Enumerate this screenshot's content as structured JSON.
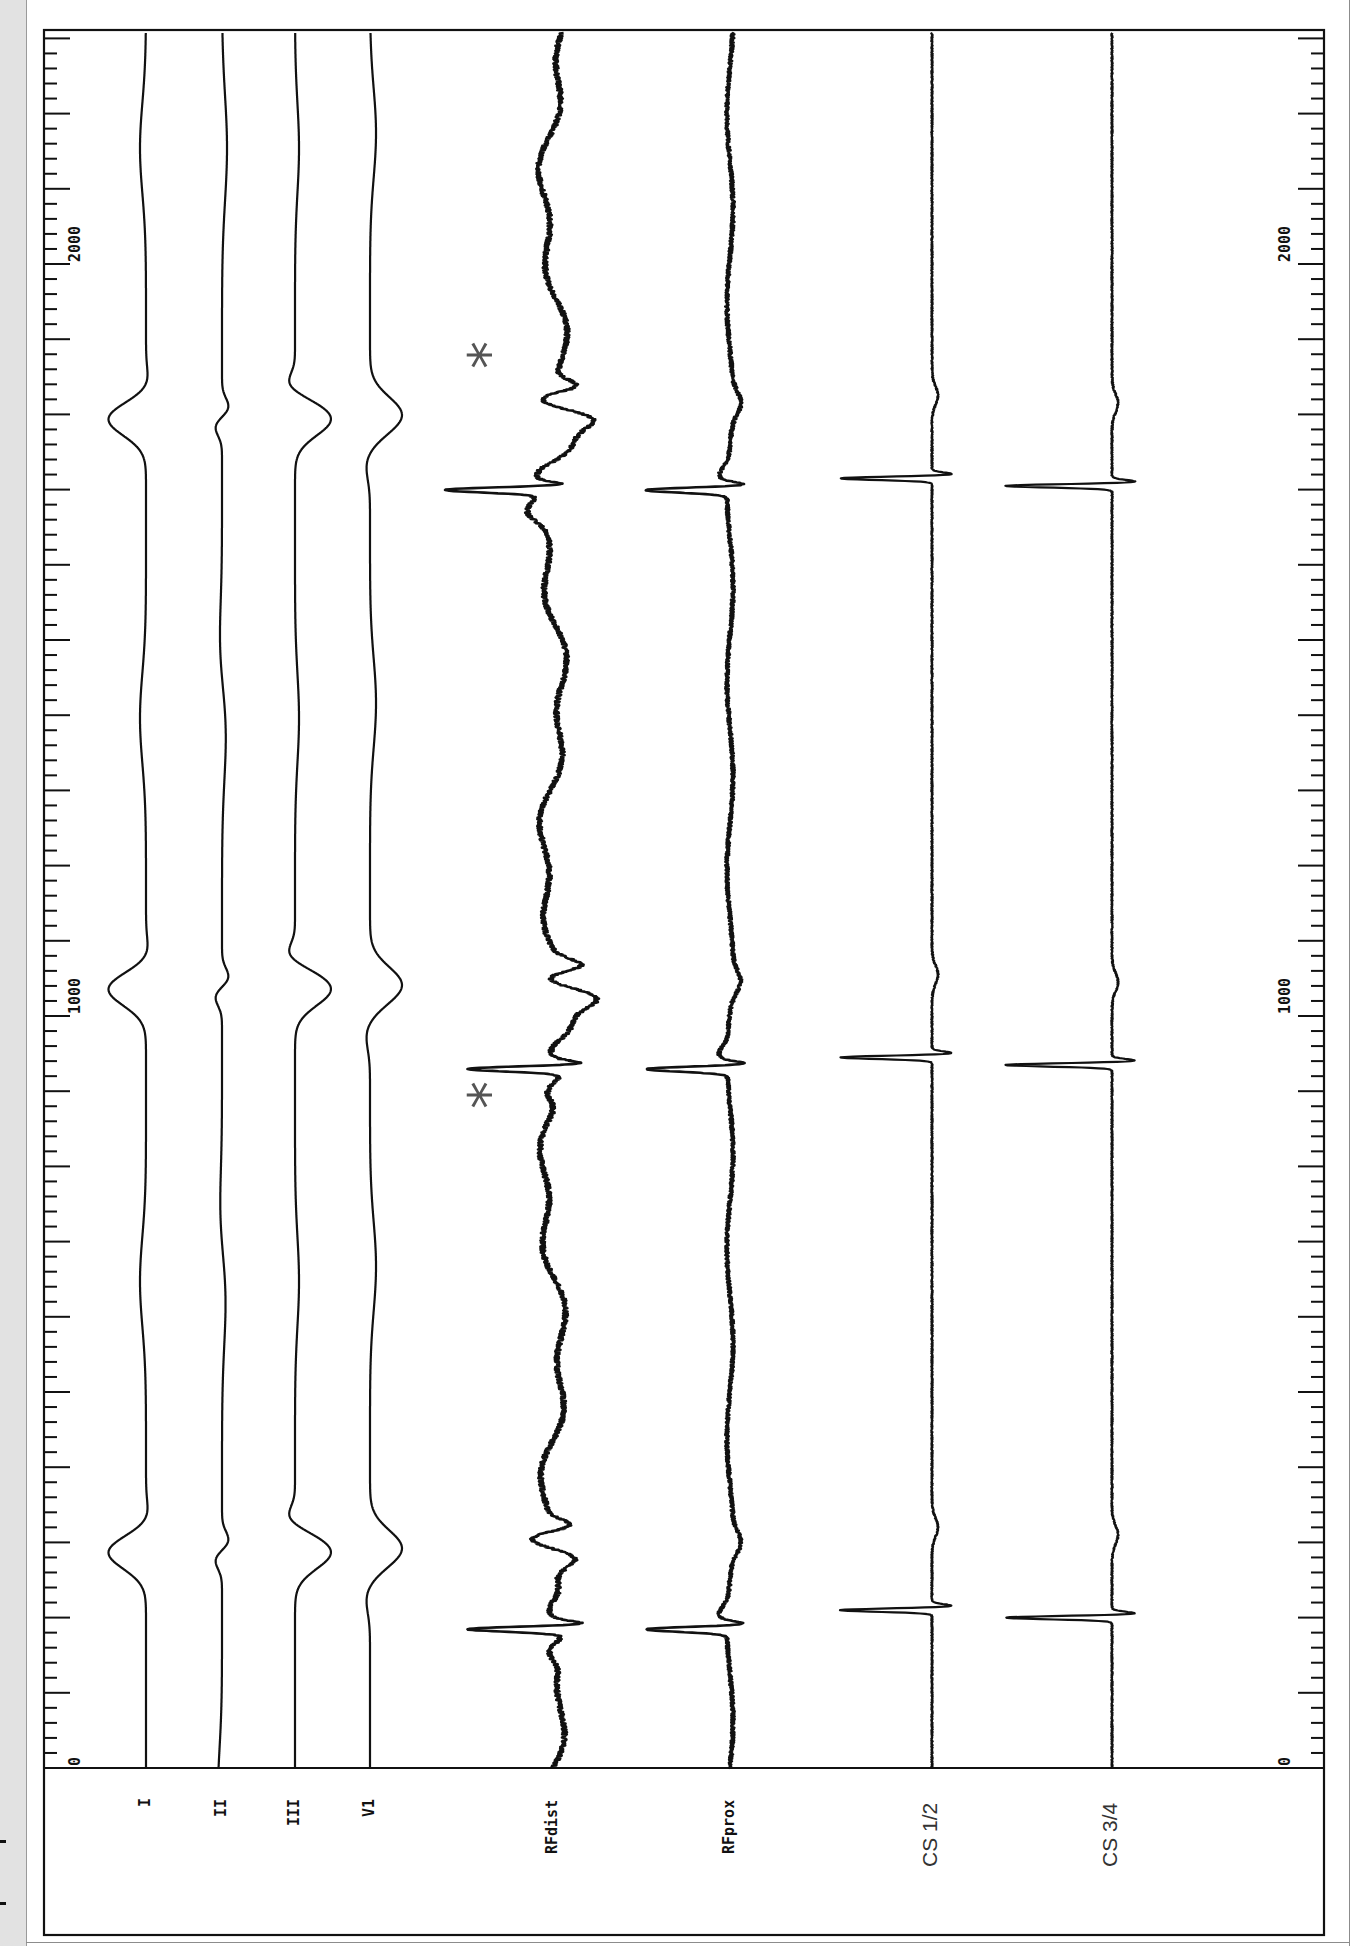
{
  "figure": {
    "title": "",
    "orientation": "rotated-90",
    "colors": {
      "trace": "#111111",
      "frame": "#111111",
      "annotation": "#555555",
      "background": "#ffffff",
      "page": "#e2e2e2"
    }
  },
  "axis": {
    "unit": "ms",
    "tick_labels_left": [
      "0",
      "1000",
      "2000"
    ],
    "tick_labels_right": [
      "0",
      "1000",
      "2000"
    ],
    "minor_tick_ms": 20,
    "major_tick_ms": 100,
    "range_ms": [
      0,
      2320
    ]
  },
  "channels": [
    {
      "id": "I",
      "label": "I",
      "style": "mono"
    },
    {
      "id": "II",
      "label": "II",
      "style": "mono"
    },
    {
      "id": "III",
      "label": "III",
      "style": "mono"
    },
    {
      "id": "V1",
      "label": "V1",
      "style": "mono"
    },
    {
      "id": "RFdist",
      "label": "RFdist",
      "style": "mono"
    },
    {
      "id": "RFprox",
      "label": "RFprox",
      "style": "mono"
    },
    {
      "id": "CS12",
      "label": "CS 1/2",
      "style": "sans"
    },
    {
      "id": "CS34",
      "label": "CS 3/4",
      "style": "sans"
    }
  ],
  "annotations": [
    {
      "symbol": "*",
      "channel": "RFdist",
      "time_ms": 905
    },
    {
      "symbol": "*",
      "channel": "RFdist",
      "time_ms": 1890
    }
  ],
  "chart_data": {
    "type": "line",
    "xlabel": "Time (ms)",
    "ylabel": "",
    "xlim": [
      0,
      2320
    ],
    "x_ticks": [
      0,
      1000,
      2000
    ],
    "grid": false,
    "legend": "channel labels along time axis origin",
    "series": [
      {
        "name": "I",
        "beat_times_ms": [
          287,
          1036,
          1794
        ],
        "deflection": "negative QRS",
        "amplitude_rel": 0.45
      },
      {
        "name": "II",
        "beat_times_ms": [
          287,
          1036,
          1794
        ],
        "deflection": "low-amplitude biphasic",
        "amplitude_rel": 0.1
      },
      {
        "name": "III",
        "beat_times_ms": [
          287,
          1036,
          1794
        ],
        "deflection": "positive QRS",
        "amplitude_rel": 0.45
      },
      {
        "name": "V1",
        "beat_times_ms": [
          287,
          1036,
          1794
        ],
        "deflection": "positive QRS",
        "amplitude_rel": 0.4
      },
      {
        "name": "RFdist",
        "beat_times_ms": [
          185,
          930,
          1700
        ],
        "deflection": "large sharp biphasic spike + far-field",
        "amplitude_rel": 1.3
      },
      {
        "name": "RFprox",
        "beat_times_ms": [
          185,
          930,
          1700
        ],
        "deflection": "sharp biphasic spike",
        "amplitude_rel": 1.25
      },
      {
        "name": "CS 1/2",
        "beat_times_ms": [
          210,
          945,
          1715
        ],
        "deflection": "sharp narrow spike",
        "amplitude_rel": 1.3
      },
      {
        "name": "CS 3/4",
        "beat_times_ms": [
          200,
          935,
          1705
        ],
        "deflection": "sharp narrow spike",
        "amplitude_rel": 1.5
      }
    ],
    "annotations": [
      {
        "text": "*",
        "channel": "RFdist",
        "x_ms": 905
      },
      {
        "text": "*",
        "channel": "RFdist",
        "x_ms": 1890
      }
    ]
  }
}
